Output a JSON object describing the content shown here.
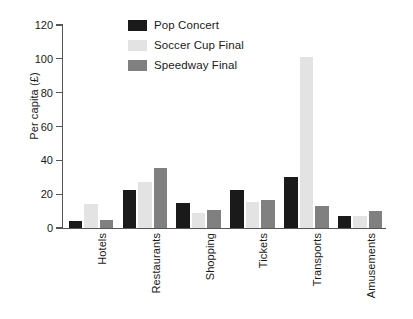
{
  "chart_data": {
    "type": "bar",
    "title": "",
    "subtitle": "",
    "xlabel": "",
    "ylabel": "Per capita (£)",
    "ylim": [
      0,
      120
    ],
    "yticks": [
      0,
      20,
      40,
      60,
      80,
      100,
      120
    ],
    "ytick_labels": [
      "0",
      "20",
      "40",
      "60",
      "80",
      "100",
      "120"
    ],
    "grid": false,
    "legend_position": "top-center",
    "categories": [
      "Hotels",
      "Restaurants",
      "Shopping",
      "Tickets",
      "Transports",
      "Amusements"
    ],
    "series": [
      {
        "name": "Pop Concert",
        "color": "#1a1a1a",
        "values": [
          4,
          22.5,
          14.5,
          22.5,
          30,
          7
        ]
      },
      {
        "name": "Soccer Cup Final",
        "color": "#e3e3e3",
        "values": [
          14,
          27,
          9,
          15.5,
          101,
          7
        ]
      },
      {
        "name": "Speedway Final",
        "color": "#808080",
        "values": [
          5,
          35.5,
          10.5,
          16.5,
          13,
          10
        ]
      }
    ]
  },
  "colors": {
    "axis": "#555555",
    "text": "#1a1a1a",
    "background": "#ffffff"
  }
}
